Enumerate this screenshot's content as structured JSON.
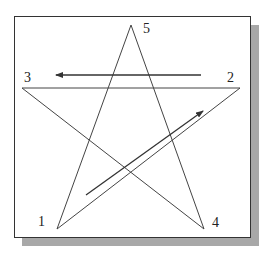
{
  "figure": {
    "colors": {
      "line": "#444444",
      "arrow": "#333333",
      "frame_border": "#333333",
      "shadow": "#a8a8a8",
      "background": "#ffffff"
    },
    "vertices": [
      {
        "label": "1",
        "x": 57,
        "y": 229
      },
      {
        "label": "2",
        "x": 240,
        "y": 88
      },
      {
        "label": "3",
        "x": 22,
        "y": 88
      },
      {
        "label": "4",
        "x": 204,
        "y": 229
      },
      {
        "label": "5",
        "x": 131,
        "y": 25
      }
    ],
    "path_order": [
      "1",
      "2",
      "3",
      "4",
      "5",
      "1"
    ],
    "arrows": [
      {
        "name": "arrow-1-to-2",
        "from": [
          86,
          195
        ],
        "to": [
          203,
          111
        ]
      },
      {
        "name": "arrow-2-to-3",
        "from": [
          201,
          75
        ],
        "to": [
          56,
          75
        ]
      }
    ]
  },
  "labels": {
    "v1": "1",
    "v2": "2",
    "v3": "3",
    "v4": "4",
    "v5": "5"
  }
}
